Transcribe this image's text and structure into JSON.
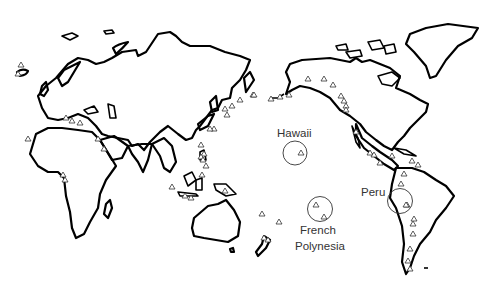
{
  "map": {
    "type": "world outline map (Pacific-centered)",
    "labels": {
      "hawaii": "Hawaii",
      "french_polynesia_line1": "French",
      "french_polynesia_line2": "Polynesia",
      "peru": "Peru"
    },
    "highlighted_regions": [
      {
        "name": "Hawaii",
        "circle": {
          "cx": 295,
          "cy": 153,
          "r": 12
        }
      },
      {
        "name": "French Polynesia",
        "circle": {
          "cx": 320,
          "cy": 209,
          "r": 12.5
        }
      },
      {
        "name": "Peru",
        "circle": {
          "cx": 400,
          "cy": 201,
          "r": 12.5
        }
      }
    ],
    "marker_symbol": "open-triangle",
    "colors": {
      "outline": "#000000",
      "marker": "#333333",
      "label": "#333333",
      "background": "#ffffff"
    }
  }
}
